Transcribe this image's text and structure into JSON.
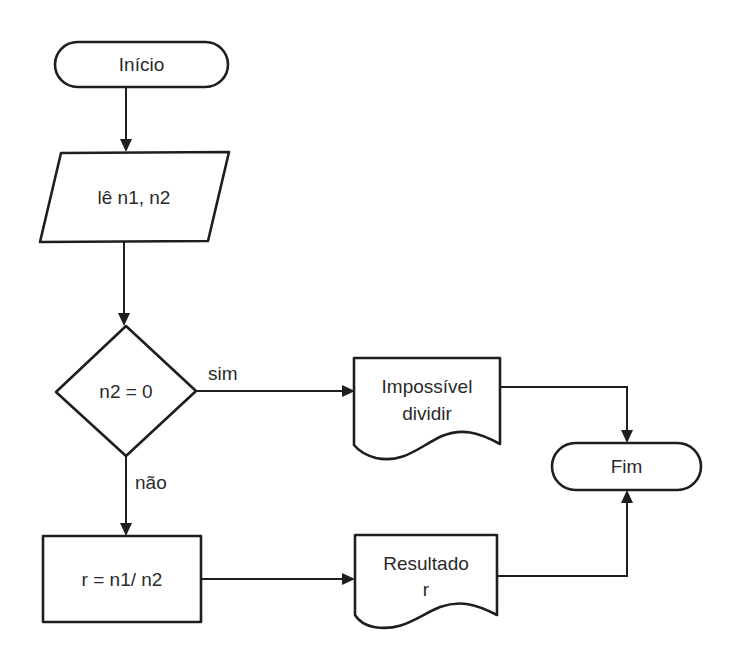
{
  "diagram": {
    "type": "flowchart",
    "colors": {
      "stroke": "#1e1e1e",
      "text": "#2a2a2a",
      "background": "#ffffff"
    },
    "nodes": {
      "start": {
        "shape": "terminal",
        "label": "Início"
      },
      "input": {
        "shape": "parallelogram",
        "label": "lê n1, n2"
      },
      "decision": {
        "shape": "diamond",
        "label": "n2 = 0"
      },
      "process": {
        "shape": "rectangle",
        "label": "r = n1/ n2"
      },
      "error_output": {
        "shape": "document",
        "label_line1": "Impossível",
        "label_line2": "dividir"
      },
      "result_output": {
        "shape": "document",
        "label_line1": "Resultado",
        "label_line2": "r"
      },
      "end": {
        "shape": "terminal",
        "label": "Fim"
      }
    },
    "edges": {
      "yes_label": "sim",
      "no_label": "não",
      "list": [
        {
          "from": "start",
          "to": "input"
        },
        {
          "from": "input",
          "to": "decision"
        },
        {
          "from": "decision",
          "to": "error_output",
          "label": "sim"
        },
        {
          "from": "decision",
          "to": "process",
          "label": "não"
        },
        {
          "from": "process",
          "to": "result_output"
        },
        {
          "from": "error_output",
          "to": "end"
        },
        {
          "from": "result_output",
          "to": "end"
        }
      ]
    }
  }
}
